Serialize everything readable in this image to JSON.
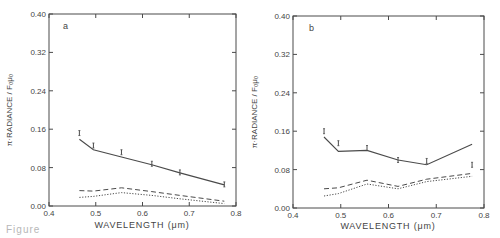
{
  "caption_fragment": "Figure",
  "chart_data": [
    {
      "type": "line",
      "panel_label": "a",
      "title": "",
      "xlabel": "WAVELENGTH (μm)",
      "ylabel": "π·RADIANCE / F₀μ₀",
      "xlim": [
        0.4,
        0.8
      ],
      "ylim": [
        0.0,
        0.4
      ],
      "xticks": [
        "0.4",
        "0.5",
        "0.6",
        "0.7",
        "0.8"
      ],
      "yticks": [
        "0.00",
        "0.08",
        "0.16",
        "0.24",
        "0.32",
        "0.40"
      ],
      "grid": false,
      "x": [
        0.465,
        0.495,
        0.555,
        0.62,
        0.68,
        0.775
      ],
      "series": [
        {
          "name": "model (solid)",
          "style": "solid",
          "values": [
            0.139,
            0.117,
            0.102,
            0.086,
            0.069,
            0.044
          ]
        },
        {
          "name": "model (dashed)",
          "style": "dashed",
          "values": [
            0.032,
            0.031,
            0.038,
            0.03,
            0.022,
            0.01
          ]
        },
        {
          "name": "model (dotted)",
          "style": "dotted",
          "values": [
            0.018,
            0.02,
            0.028,
            0.022,
            0.015,
            0.005
          ]
        },
        {
          "name": "observations",
          "style": "errorbar",
          "values": [
            0.152,
            0.126,
            0.112,
            0.088,
            0.07,
            0.045
          ]
        }
      ]
    },
    {
      "type": "line",
      "panel_label": "b",
      "title": "",
      "xlabel": "WAVELENGTH (μm)",
      "ylabel": "π·RADIANCE / F₀μ₀",
      "xlim": [
        0.4,
        0.8
      ],
      "ylim": [
        0.0,
        0.4
      ],
      "xticks": [
        "0.4",
        "0.5",
        "0.6",
        "0.7",
        "0.8"
      ],
      "yticks": [
        "0.00",
        "0.08",
        "0.16",
        "0.24",
        "0.32",
        "0.40"
      ],
      "grid": false,
      "x": [
        0.465,
        0.495,
        0.555,
        0.62,
        0.68,
        0.775
      ],
      "series": [
        {
          "name": "model (solid)",
          "style": "solid",
          "values": [
            0.148,
            0.118,
            0.12,
            0.1,
            0.09,
            0.133
          ]
        },
        {
          "name": "model (dashed)",
          "style": "dashed",
          "values": [
            0.04,
            0.042,
            0.058,
            0.045,
            0.06,
            0.072
          ]
        },
        {
          "name": "model (dotted)",
          "style": "dotted",
          "values": [
            0.025,
            0.03,
            0.05,
            0.04,
            0.055,
            0.066
          ]
        },
        {
          "name": "observations",
          "style": "errorbar",
          "values": [
            0.16,
            0.135,
            0.125,
            0.1,
            0.098,
            0.09
          ]
        }
      ]
    }
  ]
}
